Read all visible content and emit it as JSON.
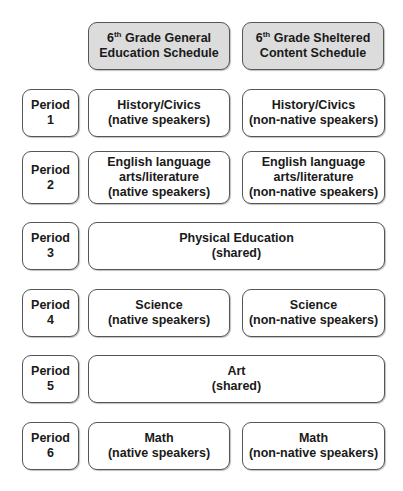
{
  "headers": [
    {
      "grade": "6",
      "suffix": "th",
      "line1": " Grade General",
      "line2": "Education Schedule"
    },
    {
      "grade": "6",
      "suffix": "th",
      "line1": " Grade Sheltered",
      "line2": "Content Schedule"
    }
  ],
  "periods": [
    {
      "label": "Period",
      "num": "1"
    },
    {
      "label": "Period",
      "num": "2"
    },
    {
      "label": "Period",
      "num": "3"
    },
    {
      "label": "Period",
      "num": "4"
    },
    {
      "label": "Period",
      "num": "5"
    },
    {
      "label": "Period",
      "num": "6"
    }
  ],
  "rows": [
    {
      "general": [
        "History/Civics",
        "(native speakers)"
      ],
      "sheltered": [
        "History/Civics",
        "(non-native speakers)"
      ]
    },
    {
      "general": [
        "English language",
        "arts/literature",
        "(native speakers)"
      ],
      "sheltered": [
        "English language",
        "arts/literature",
        "(non-native speakers)"
      ]
    },
    {
      "shared": [
        "Physical Education",
        "(shared)"
      ]
    },
    {
      "general": [
        "Science",
        "(native speakers)"
      ],
      "sheltered": [
        "Science",
        "(non-native speakers)"
      ]
    },
    {
      "shared": [
        "Art",
        "(shared)"
      ]
    },
    {
      "general": [
        "Math",
        "(native speakers)"
      ],
      "sheltered": [
        "Math",
        "(non-native speakers)"
      ]
    }
  ]
}
